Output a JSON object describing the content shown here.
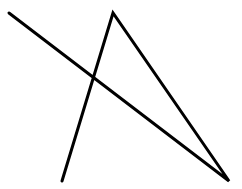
{
  "canvas": {
    "width": 242,
    "height": 189,
    "background": "#ffffff"
  },
  "drawing": {
    "stroke_color": "#000000",
    "stroke_width": 3,
    "polyline_points": [
      [
        9,
        13
      ],
      [
        229,
        181
      ],
      [
        113,
        13
      ],
      [
        62,
        181
      ]
    ]
  }
}
